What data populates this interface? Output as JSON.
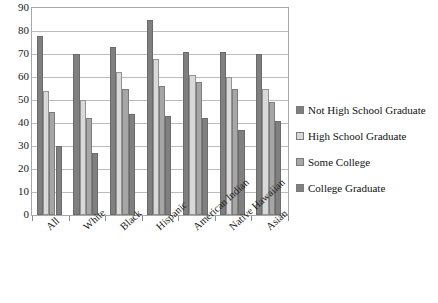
{
  "chart_data": {
    "type": "bar",
    "title": "",
    "xlabel": "",
    "ylabel": "",
    "ylim": [
      0,
      90
    ],
    "ytick_step": 10,
    "yticks": [
      "90",
      "80",
      "70",
      "60",
      "50",
      "40",
      "30",
      "20",
      "10",
      "0"
    ],
    "grid": true,
    "legend_position": "right",
    "categories": [
      "All",
      "White",
      "Black",
      "Hispanic",
      "American Indian",
      "Native Hawaiian",
      "Asian"
    ],
    "series": [
      {
        "name": "Not High School Graduate",
        "color": "#7f7f7f",
        "values": [
          78,
          70,
          73,
          85,
          71,
          71,
          70
        ]
      },
      {
        "name": "High School Graduate",
        "color": "#d9d9d9",
        "values": [
          54,
          50,
          62,
          68,
          61,
          60,
          55
        ]
      },
      {
        "name": "Some College",
        "color": "#a6a6a6",
        "values": [
          45,
          42,
          55,
          56,
          58,
          55,
          49
        ]
      },
      {
        "name": "College Graduate",
        "color": "#808080",
        "values": [
          30,
          27,
          44,
          43,
          42,
          37,
          41
        ]
      }
    ]
  },
  "legend": {
    "items": [
      "Not High School Graduate",
      "High School Graduate",
      "Some College",
      "College Graduate"
    ]
  }
}
